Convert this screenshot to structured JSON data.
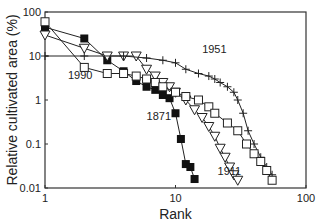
{
  "chart_data": {
    "type": "line",
    "title": "",
    "xlabel": "Rank",
    "ylabel": "Relative cultivated area (%)",
    "xscale": "log",
    "yscale": "log",
    "xlim": [
      1,
      100
    ],
    "ylim": [
      0.01,
      100
    ],
    "xticks": [
      "1",
      "10",
      "100"
    ],
    "yticks": [
      "0.01",
      "0.1",
      "1",
      "10",
      "100"
    ],
    "grid": false,
    "legend": "none (series annotated inline)",
    "series": [
      {
        "name": "1871",
        "marker": "filled-square",
        "x": [
          1,
          2,
          3,
          4,
          5,
          6,
          7,
          8,
          9,
          10,
          11,
          12,
          13,
          14
        ],
        "y": [
          45,
          25,
          8,
          4.5,
          2.7,
          2.0,
          1.7,
          1.3,
          1.1,
          0.5,
          0.13,
          0.035,
          0.03,
          0.016
        ]
      },
      {
        "name": "1911",
        "marker": "open-triangle-down",
        "x": [
          1,
          2,
          3,
          4,
          5,
          6,
          7,
          8,
          9,
          10,
          12,
          14,
          16,
          18,
          20,
          22,
          24,
          26,
          28,
          30
        ],
        "y": [
          30,
          15,
          10,
          10,
          10,
          5,
          3.5,
          2.5,
          2,
          1.5,
          1,
          0.6,
          0.4,
          0.25,
          0.15,
          0.08,
          0.05,
          0.03,
          0.02,
          0.015
        ]
      },
      {
        "name": "1951",
        "marker": "plus",
        "x": [
          1,
          2,
          4,
          6,
          8,
          10,
          12,
          15,
          18,
          20,
          22,
          25,
          28,
          30,
          33,
          36,
          40,
          45,
          50,
          55
        ],
        "y": [
          10,
          10,
          10,
          9,
          8,
          7,
          5,
          4,
          3.5,
          3,
          2.5,
          2,
          1.5,
          1,
          0.5,
          0.2,
          0.1,
          0.05,
          0.03,
          0.02
        ]
      },
      {
        "name": "1990",
        "marker": "open-square",
        "x": [
          1,
          2,
          3,
          4,
          5,
          6,
          7,
          8,
          10,
          12,
          15,
          18,
          20,
          25,
          30,
          35,
          40,
          45,
          50,
          55
        ],
        "y": [
          60,
          5.5,
          4,
          4,
          3.5,
          3,
          2.5,
          2,
          1.5,
          1.2,
          1,
          0.7,
          0.5,
          0.3,
          0.2,
          0.1,
          0.06,
          0.04,
          0.025,
          0.015
        ]
      }
    ],
    "annotations": [
      {
        "text": "1951",
        "near_x": 16,
        "near_y": 12
      },
      {
        "text": "1990",
        "near_x": 1.5,
        "near_y": 3
      },
      {
        "text": "1871",
        "near_x": 6,
        "near_y": 0.35
      },
      {
        "text": "1911",
        "near_x": 21,
        "near_y": 0.02
      }
    ]
  }
}
